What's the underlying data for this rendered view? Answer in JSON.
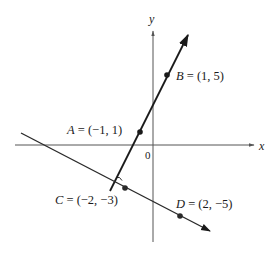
{
  "diagram": {
    "axes": {
      "x_label": "x",
      "y_label": "y",
      "origin_label": "0"
    },
    "points": [
      {
        "name": "A",
        "coords": "(−1, 1)",
        "label": "A = (−1, 1)"
      },
      {
        "name": "B",
        "coords": "(1, 5)",
        "label": "B = (1, 5)"
      },
      {
        "name": "C",
        "coords": "(−2, −3)",
        "label": "C = (−2, −3)"
      },
      {
        "name": "D",
        "coords": "(2, −5)",
        "label": "D = (2, −5)"
      }
    ],
    "lines": [
      {
        "name": "line-AB",
        "through": [
          "A",
          "B"
        ]
      },
      {
        "name": "line-CD",
        "through": [
          "C",
          "D"
        ]
      }
    ],
    "annotations": [
      "right-angle marker at intersection of line AB and line CD"
    ],
    "colors": {
      "ink": "#1a1a1a",
      "point": "#2a2a2a",
      "axis": "#555555",
      "background": "#ffffff"
    }
  }
}
